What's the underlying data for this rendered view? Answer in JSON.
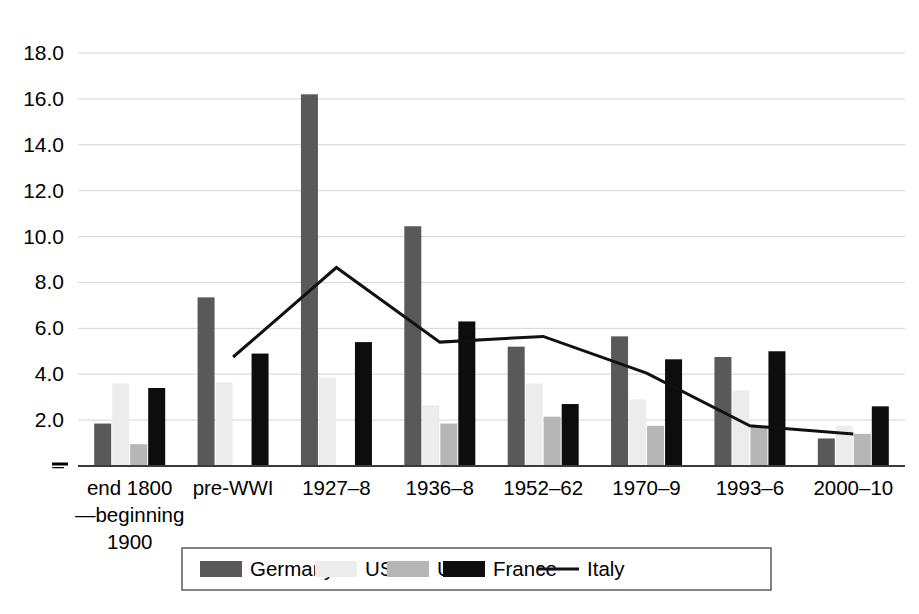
{
  "chart_data": {
    "type": "bar",
    "title": "",
    "subtitle": "",
    "xlabel": "",
    "ylabel": "",
    "ylim": [
      0,
      18
    ],
    "ytick_step": 2,
    "yticks": [
      "–",
      "2.0",
      "4.0",
      "6.0",
      "8.0",
      "10.0",
      "12.0",
      "14.0",
      "16.0",
      "18.0"
    ],
    "ytick_values": [
      0,
      2,
      4,
      6,
      8,
      10,
      12,
      14,
      16,
      18
    ],
    "grid": true,
    "legend_position": "bottom",
    "categories": [
      "end 1800\n—beginning\n1900",
      "pre-WWI",
      "1927–8",
      "1936–8",
      "1952–62",
      "1970–9",
      "1993–6",
      "2000–10"
    ],
    "category_lines": [
      [
        "end 1800",
        "—beginning",
        "1900"
      ],
      [
        "pre-WWI"
      ],
      [
        "1927–8"
      ],
      [
        "1936–8"
      ],
      [
        "1952–62"
      ],
      [
        "1970–9"
      ],
      [
        "1993–6"
      ],
      [
        "2000–10"
      ]
    ],
    "series": [
      {
        "name": "Germany",
        "kind": "bar",
        "color": "#595959",
        "values": [
          1.85,
          7.35,
          16.2,
          10.45,
          5.2,
          5.65,
          4.75,
          1.2
        ]
      },
      {
        "name": "USA",
        "kind": "bar",
        "color": "#ececec",
        "values": [
          3.6,
          3.65,
          3.85,
          2.65,
          3.6,
          2.9,
          3.3,
          1.75
        ]
      },
      {
        "name": "UK",
        "kind": "bar",
        "color": "#b6b6b6",
        "values": [
          0.95,
          null,
          null,
          1.85,
          2.15,
          1.75,
          1.75,
          1.4
        ]
      },
      {
        "name": "France",
        "kind": "bar",
        "color": "#0d0d0d",
        "values": [
          3.4,
          4.9,
          5.4,
          6.3,
          2.7,
          4.65,
          5.0,
          2.6
        ]
      },
      {
        "name": "Italy",
        "kind": "line",
        "color": "#111111",
        "values": [
          null,
          4.75,
          8.65,
          5.4,
          5.65,
          4.05,
          1.75,
          1.4
        ]
      }
    ]
  },
  "legend": {
    "items": [
      {
        "label": "Germany",
        "swatch": "#595959",
        "type": "box"
      },
      {
        "label": "USA",
        "swatch": "#ececec",
        "type": "box"
      },
      {
        "label": "UK",
        "swatch": "#b6b6b6",
        "type": "box"
      },
      {
        "label": "France",
        "swatch": "#0d0d0d",
        "type": "box"
      },
      {
        "label": "Italy",
        "swatch": "#111111",
        "type": "line"
      }
    ]
  }
}
